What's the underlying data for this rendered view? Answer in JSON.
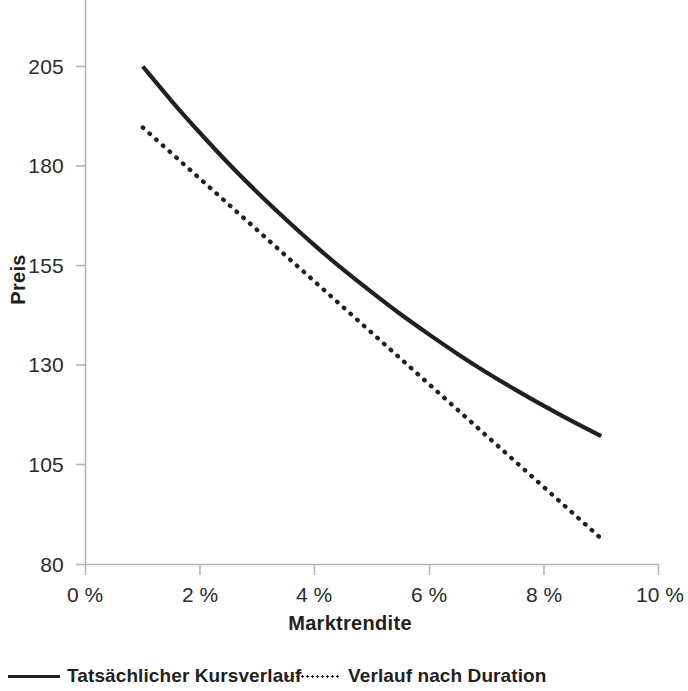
{
  "chart_data": {
    "type": "line",
    "title": "",
    "subtitle": "",
    "xlabel": "Marktrendite",
    "ylabel": "Preis",
    "x_tick_labels": [
      "0 %",
      "2 %",
      "4 %",
      "6 %",
      "8 %",
      "10 %"
    ],
    "x_ticks": [
      0,
      2,
      4,
      6,
      8,
      10
    ],
    "y_tick_labels": [
      "205",
      "180",
      "155",
      "130",
      "105",
      "80"
    ],
    "y_ticks": [
      205,
      180,
      155,
      130,
      105,
      80
    ],
    "xlim": [
      0,
      10
    ],
    "ylim": [
      80,
      205
    ],
    "grid": false,
    "legend_position": "bottom",
    "axis_color": "#b5b5b5",
    "series": [
      {
        "name": "Tatsächlicher Kursverlauf",
        "style": "solid",
        "color": "#231f20",
        "x": [
          1.0,
          1.5,
          2.0,
          2.5,
          3.0,
          3.5,
          4.0,
          4.5,
          5.0,
          5.5,
          6.0,
          6.5,
          7.0,
          7.5,
          8.0,
          8.5,
          9.0
        ],
        "y": [
          205.0,
          196.4,
          188.3,
          180.6,
          173.4,
          166.6,
          160.1,
          154.0,
          148.3,
          142.8,
          137.7,
          132.8,
          128.2,
          123.9,
          119.8,
          115.9,
          112.2
        ]
      },
      {
        "name": "Verlauf nach Duration",
        "style": "dotted",
        "color": "#231f20",
        "x": [
          1.0,
          9.0
        ],
        "y": [
          189.7,
          86.5
        ]
      }
    ],
    "legend": [
      {
        "label": "Tatsächlicher Kursverlauf",
        "style": "solid",
        "color": "#231f20"
      },
      {
        "label": "Verlauf nach Duration",
        "style": "dotted",
        "color": "#231f20"
      }
    ]
  },
  "axes": {
    "y_title": "Preis",
    "x_title": "Marktrendite",
    "y_labels": [
      "205",
      "180",
      "155",
      "130",
      "105",
      "80"
    ],
    "x_labels": [
      "0 %",
      "2 %",
      "4 %",
      "6 %",
      "8 %",
      "10 %"
    ]
  },
  "legend": {
    "actual_label": "Tatsächlicher Kursverlauf",
    "duration_label": "Verlauf nach Duration"
  }
}
